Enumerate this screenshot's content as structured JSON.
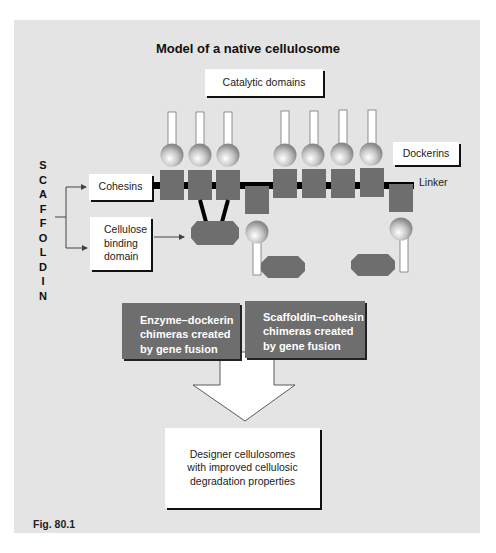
{
  "figure": {
    "title": "Model of a native cellulosome",
    "label": "Fig. 80.1",
    "vertical_label": [
      "S",
      "C",
      "A",
      "F",
      "F",
      "O",
      "L",
      "D",
      "I",
      "N"
    ],
    "labels": {
      "catalytic_domains": "Catalytic domains",
      "dockerins": "Dockerins",
      "linker": "Linker",
      "cohesins": "Cohesins",
      "cellulose_binding_line1": "Cellulose",
      "cellulose_binding_line2": "binding",
      "cellulose_binding_line3": "domain"
    },
    "chimera_boxes": [
      {
        "line1": "Enzyme–dockerin",
        "line2": "chimeras created",
        "line3": "by gene fusion"
      },
      {
        "line1": "Scaffoldin–cohesin",
        "line2": "chimeras created",
        "line3": "by gene fusion"
      }
    ],
    "result_box": {
      "line1": "Designer cellulosomes",
      "line2": "with improved cellulosic",
      "line3": "degradation properties"
    },
    "colors": {
      "panel": "#e4e4e4",
      "module": "#6e6e6e",
      "linker": "#000000",
      "box": "#ffffff"
    }
  }
}
